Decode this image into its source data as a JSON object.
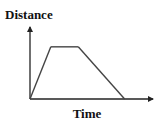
{
  "chart_data": {
    "type": "line",
    "title": "",
    "ylabel": "Distance",
    "xlabel": "Time",
    "x": [
      0,
      0.22,
      0.51,
      1.0
    ],
    "series": [
      {
        "name": "distance-time",
        "values": [
          0,
          1,
          1,
          0
        ]
      }
    ],
    "xlim": [
      0,
      1.3
    ],
    "ylim": [
      0,
      1.38
    ],
    "grid": false,
    "legend": "none",
    "colors": {
      "axis": "#222222",
      "line": "#444444"
    }
  }
}
